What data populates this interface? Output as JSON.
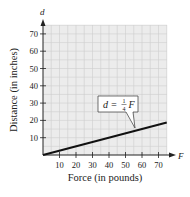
{
  "chart_data": {
    "type": "line",
    "title": "",
    "xlabel": "Force (in pounds)",
    "ylabel": "Distance (in inches)",
    "x_axis_var": "F",
    "y_axis_var": "d",
    "xlim": [
      0,
      75
    ],
    "ylim": [
      0,
      75
    ],
    "x_ticks": [
      10,
      20,
      30,
      40,
      50,
      60,
      70
    ],
    "y_ticks": [
      10,
      20,
      30,
      40,
      50,
      60,
      70
    ],
    "grid": true,
    "series": [
      {
        "name": "d = 1/4 F",
        "x": [
          0,
          75
        ],
        "y": [
          0,
          18.75
        ]
      }
    ],
    "annotations": [
      {
        "text_lhs": "d =",
        "fraction_num": "1",
        "fraction_den": "4",
        "text_rhs": "F",
        "points_to_x": 60,
        "points_to_y": 15
      }
    ]
  }
}
